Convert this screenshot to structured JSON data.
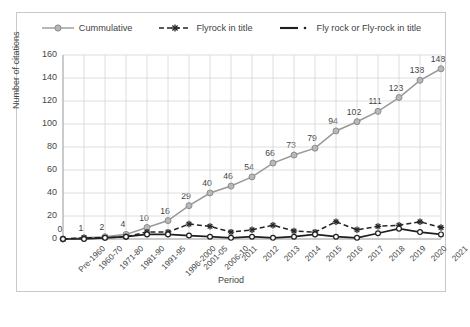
{
  "chart_data": {
    "type": "line",
    "title": "",
    "xlabel": "Period",
    "ylabel": "Number of citations",
    "ylim": [
      0,
      160
    ],
    "ytick_values": [
      0,
      20,
      40,
      60,
      80,
      100,
      120,
      140,
      160
    ],
    "grid": true,
    "legend_position": "top",
    "categories": [
      "Pre-1960",
      "1960-70",
      "1971-80",
      "1981-90",
      "1991-95",
      "1996-2000",
      "2001-05",
      "2006-10",
      "2011",
      "2012",
      "2013",
      "2014",
      "2015",
      "2016",
      "2017",
      "2018",
      "2019",
      "2020",
      "2021"
    ],
    "series": [
      {
        "name": "Cummulative",
        "style": "solid-gray-circle",
        "color": "#9a9a9a",
        "labels_shown": true,
        "values": [
          0,
          1,
          2,
          4,
          10,
          16,
          29,
          40,
          46,
          54,
          66,
          73,
          79,
          94,
          102,
          111,
          123,
          138,
          148
        ]
      },
      {
        "name": "Flyrock in title",
        "style": "dashed-dark-star",
        "color": "#262626",
        "labels_shown": false,
        "values": [
          0,
          1,
          1,
          2,
          6,
          6,
          13,
          11,
          6,
          8,
          12,
          7,
          6,
          15,
          8,
          11,
          12,
          15,
          10
        ]
      },
      {
        "name": "Fly rock or Fly-rock in title",
        "style": "solid-dark-circle",
        "color": "#1f1f1f",
        "labels_shown": false,
        "values": [
          0,
          0,
          1,
          2,
          4,
          4,
          3,
          2,
          1,
          2,
          1,
          2,
          4,
          2,
          1,
          5,
          9,
          6,
          4
        ]
      }
    ],
    "data_labels": [
      0,
      1,
      2,
      4,
      10,
      16,
      29,
      40,
      46,
      54,
      66,
      73,
      79,
      94,
      102,
      111,
      123,
      138,
      148
    ]
  },
  "legend": {
    "items": [
      {
        "label": "Cummulative"
      },
      {
        "label": "Flyrock in title"
      },
      {
        "label": "Fly rock or Fly-rock in title"
      }
    ]
  }
}
